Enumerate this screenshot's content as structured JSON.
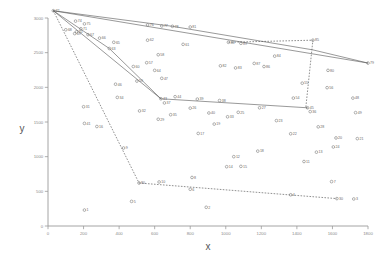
{
  "chart_data": {
    "type": "scatter",
    "title": "",
    "xlabel": "x",
    "ylabel": "y",
    "xlim": [
      0,
      1800
    ],
    "ylim": [
      0,
      3000
    ],
    "xticks": [
      0,
      200,
      400,
      600,
      800,
      1000,
      1200,
      1400,
      1600,
      1800
    ],
    "yticks": [
      0,
      500,
      1000,
      1500,
      2000,
      2500,
      3000
    ],
    "grid": false,
    "legend": null,
    "marker": "open-circle",
    "point_label_position": "right",
    "points": [
      {
        "label": "72",
        "x": 30,
        "y": 3105
      },
      {
        "label": "74",
        "x": 155,
        "y": 2955
      },
      {
        "label": "75",
        "x": 205,
        "y": 2915
      },
      {
        "label": "68",
        "x": 100,
        "y": 2830
      },
      {
        "label": "71",
        "x": 185,
        "y": 2845
      },
      {
        "label": "70",
        "x": 160,
        "y": 2800
      },
      {
        "label": "69",
        "x": 150,
        "y": 2775
      },
      {
        "label": "67",
        "x": 225,
        "y": 2760
      },
      {
        "label": "66",
        "x": 290,
        "y": 2710
      },
      {
        "label": "65",
        "x": 370,
        "y": 2650
      },
      {
        "label": "63",
        "x": 345,
        "y": 2560
      },
      {
        "label": "76",
        "x": 560,
        "y": 2900
      },
      {
        "label": "77",
        "x": 640,
        "y": 2885
      },
      {
        "label": "78",
        "x": 700,
        "y": 2880
      },
      {
        "label": "81",
        "x": 800,
        "y": 2870
      },
      {
        "label": "62",
        "x": 560,
        "y": 2680
      },
      {
        "label": "61",
        "x": 760,
        "y": 2620
      },
      {
        "label": "58",
        "x": 620,
        "y": 2470
      },
      {
        "label": "57",
        "x": 555,
        "y": 2355
      },
      {
        "label": "64",
        "x": 600,
        "y": 2245
      },
      {
        "label": "60",
        "x": 480,
        "y": 2300
      },
      {
        "label": "59",
        "x": 500,
        "y": 2090
      },
      {
        "label": "47",
        "x": 640,
        "y": 2130
      },
      {
        "label": "43",
        "x": 635,
        "y": 1835
      },
      {
        "label": "37",
        "x": 655,
        "y": 1775
      },
      {
        "label": "44",
        "x": 715,
        "y": 1865
      },
      {
        "label": "39",
        "x": 840,
        "y": 1830
      },
      {
        "label": "38",
        "x": 965,
        "y": 1810
      },
      {
        "label": "88",
        "x": 1015,
        "y": 2650
      },
      {
        "label": "89",
        "x": 1085,
        "y": 2635
      },
      {
        "label": "85",
        "x": 1490,
        "y": 2680
      },
      {
        "label": "84",
        "x": 1275,
        "y": 2450
      },
      {
        "label": "87",
        "x": 1160,
        "y": 2345
      },
      {
        "label": "86",
        "x": 1215,
        "y": 2300
      },
      {
        "label": "83",
        "x": 1055,
        "y": 2280
      },
      {
        "label": "82",
        "x": 970,
        "y": 2310
      },
      {
        "label": "80",
        "x": 1575,
        "y": 2245
      },
      {
        "label": "79",
        "x": 1800,
        "y": 2350
      },
      {
        "label": "55",
        "x": 1430,
        "y": 2060
      },
      {
        "label": "56",
        "x": 1570,
        "y": 1995
      },
      {
        "label": "48",
        "x": 1715,
        "y": 1845
      },
      {
        "label": "54",
        "x": 1380,
        "y": 1845
      },
      {
        "label": "45",
        "x": 1460,
        "y": 1705
      },
      {
        "label": "36",
        "x": 1475,
        "y": 1650
      },
      {
        "label": "49",
        "x": 1730,
        "y": 1635
      },
      {
        "label": "46",
        "x": 380,
        "y": 2045
      },
      {
        "label": "34",
        "x": 390,
        "y": 1855
      },
      {
        "label": "31",
        "x": 200,
        "y": 1720
      },
      {
        "label": "32",
        "x": 515,
        "y": 1660
      },
      {
        "label": "41",
        "x": 205,
        "y": 1480
      },
      {
        "label": "16",
        "x": 275,
        "y": 1435
      },
      {
        "label": "26",
        "x": 800,
        "y": 1700
      },
      {
        "label": "40",
        "x": 905,
        "y": 1630
      },
      {
        "label": "25",
        "x": 1070,
        "y": 1640
      },
      {
        "label": "35",
        "x": 690,
        "y": 1605
      },
      {
        "label": "33",
        "x": 1010,
        "y": 1575
      },
      {
        "label": "29",
        "x": 620,
        "y": 1540
      },
      {
        "label": "19",
        "x": 935,
        "y": 1470
      },
      {
        "label": "17",
        "x": 845,
        "y": 1335
      },
      {
        "label": "27",
        "x": 1190,
        "y": 1705
      },
      {
        "label": "23",
        "x": 1285,
        "y": 1520
      },
      {
        "label": "28",
        "x": 1520,
        "y": 1430
      },
      {
        "label": "22",
        "x": 1365,
        "y": 1330
      },
      {
        "label": "20",
        "x": 1620,
        "y": 1270
      },
      {
        "label": "21",
        "x": 1740,
        "y": 1260
      },
      {
        "label": "24",
        "x": 1605,
        "y": 1140
      },
      {
        "label": "13",
        "x": 1510,
        "y": 1065
      },
      {
        "label": "18",
        "x": 1180,
        "y": 1080
      },
      {
        "label": "12",
        "x": 1045,
        "y": 1000
      },
      {
        "label": "11",
        "x": 1440,
        "y": 930
      },
      {
        "label": "15",
        "x": 1085,
        "y": 860
      },
      {
        "label": "14",
        "x": 1005,
        "y": 855
      },
      {
        "label": "9",
        "x": 425,
        "y": 1125
      },
      {
        "label": "10",
        "x": 625,
        "y": 635
      },
      {
        "label": "80",
        "x": 512,
        "y": 620
      },
      {
        "label": "5",
        "x": 470,
        "y": 355
      },
      {
        "label": "1",
        "x": 205,
        "y": 230
      },
      {
        "label": "6",
        "x": 800,
        "y": 530
      },
      {
        "label": "2",
        "x": 890,
        "y": 270
      },
      {
        "label": "4",
        "x": 1365,
        "y": 450
      },
      {
        "label": "8",
        "x": 810,
        "y": 700
      },
      {
        "label": "7",
        "x": 1595,
        "y": 640
      },
      {
        "label": "30",
        "x": 1625,
        "y": 395
      },
      {
        "label": "3",
        "x": 1720,
        "y": 390
      }
    ],
    "routes": [
      {
        "name": "tour-solid-a",
        "style": "solid",
        "path": [
          [
            30,
            3105
          ],
          [
            1800,
            2350
          ]
        ]
      },
      {
        "name": "tour-solid-b",
        "style": "solid",
        "path": [
          [
            30,
            3105
          ],
          [
            700,
            2880
          ],
          [
            1490,
            2540
          ],
          [
            1800,
            2350
          ]
        ]
      },
      {
        "name": "tour-solid-c",
        "style": "solid",
        "path": [
          [
            30,
            3105
          ],
          [
            635,
            1835
          ]
        ]
      },
      {
        "name": "tour-solid-d",
        "style": "solid",
        "path": [
          [
            30,
            3105
          ],
          [
            345,
            2560
          ],
          [
            635,
            1835
          ]
        ]
      },
      {
        "name": "tour-solid-e",
        "style": "solid",
        "path": [
          [
            635,
            1835
          ],
          [
            1460,
            1705
          ]
        ]
      },
      {
        "name": "tour-dashed-right",
        "style": "dashed",
        "path": [
          [
            1015,
            2650
          ],
          [
            1490,
            2680
          ],
          [
            1450,
            1705
          ],
          [
            1460,
            1700
          ]
        ]
      },
      {
        "name": "tour-dashed-left",
        "style": "dashed",
        "path": [
          [
            30,
            3105
          ],
          [
            512,
            620
          ]
        ]
      },
      {
        "name": "tour-dashed-bottom",
        "style": "dashed",
        "path": [
          [
            512,
            620
          ],
          [
            1625,
            395
          ]
        ]
      }
    ]
  }
}
